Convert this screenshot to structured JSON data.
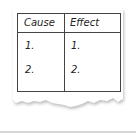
{
  "table": {
    "headers": [
      "Cause",
      "Effect"
    ],
    "rows": [
      [
        "1.",
        "1."
      ],
      [
        "2.",
        "2."
      ]
    ]
  },
  "colors": {
    "border": "#444444",
    "paper": "#ffffff",
    "shadow": "#cfcfcf",
    "rule": "#d8d8d8"
  }
}
